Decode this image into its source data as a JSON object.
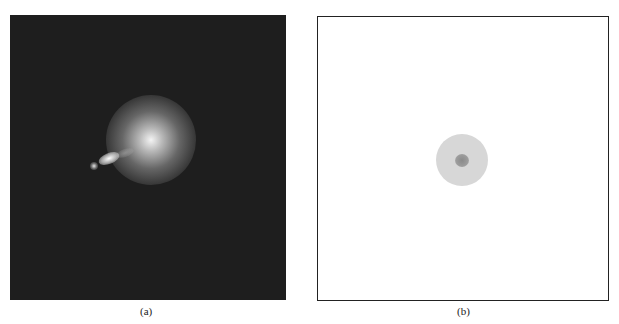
{
  "figure": {
    "panels": [
      {
        "id": "a",
        "caption": "(a)",
        "description": "Dark field image with bright diffuse blob and elongated jet-like feature"
      },
      {
        "id": "b",
        "caption": "(b)",
        "description": "Schematic: light gray disk with darker central core on white background, framed"
      }
    ]
  },
  "colors": {
    "panel_a_background": "#1e1e1e",
    "panel_b_background": "#ffffff",
    "disk_outer": "#d7d7d7",
    "disk_core": "#8a8a8a"
  }
}
